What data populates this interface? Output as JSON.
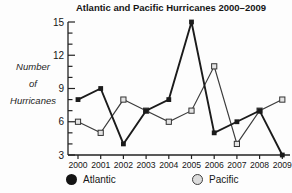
{
  "chart_data": {
    "type": "line",
    "title": "Atlantic and Pacific Hurricanes 2000–2009",
    "ylabel": "Number of Hurricanes",
    "ylabel_lines": [
      "Number",
      "of",
      "Hurricanes"
    ],
    "xlabel": "",
    "categories": [
      "2000",
      "2001",
      "2002",
      "2003",
      "2004",
      "2005",
      "2006",
      "2007",
      "2008",
      "2009"
    ],
    "series": [
      {
        "name": "Atlantic",
        "values": [
          8,
          9,
          4,
          7,
          8,
          15,
          5,
          6,
          7,
          3
        ],
        "color": "#1b1b1b",
        "marker": "filled-square",
        "line_width": 1.9
      },
      {
        "name": "Pacific",
        "values": [
          6,
          5,
          8,
          7,
          6,
          7,
          11,
          4,
          7,
          8
        ],
        "color": "#3c3c3c",
        "marker": "open-square",
        "marker_fill": "#e4e4e4",
        "line_width": 1.2
      }
    ],
    "ylim": [
      3,
      15
    ],
    "ytick_major": 3,
    "ytick_minor": 1,
    "grid": false,
    "legend_position": "bottom",
    "axis_color": "#222222"
  }
}
